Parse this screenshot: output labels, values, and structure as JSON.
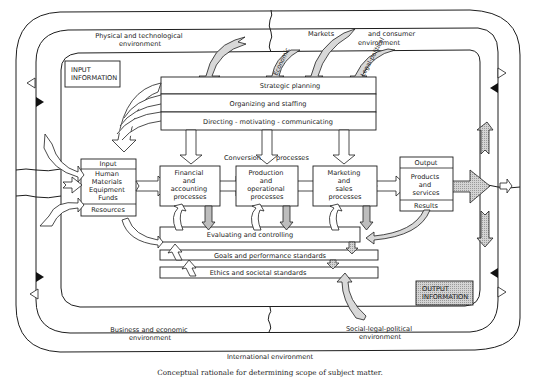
{
  "diagram": {
    "environments": {
      "physical_technological": [
        "Physical and technological",
        "environment"
      ],
      "markets_consumer": [
        "Markets",
        "and consumer",
        "environment"
      ],
      "business_economic": [
        "Business and economic",
        "environment"
      ],
      "social_legal_political": [
        "Social-legal-political",
        "environment"
      ],
      "international": "International environment"
    },
    "influence_arrows": {
      "economic": "Economic",
      "legal_political": "Legal-political"
    },
    "info_boxes": {
      "input": [
        "INPUT",
        "INFORMATION"
      ],
      "output": [
        "OUTPUT",
        "INFORMATION"
      ]
    },
    "management_functions": [
      "Strategic planning",
      "Organizing and staffing",
      "Directing - motivating - communicating"
    ],
    "conversion_label": [
      "Conversion",
      "processes"
    ],
    "input_block": {
      "header": "Input",
      "items": [
        "Human",
        "Materials",
        "Equipment",
        "Funds"
      ],
      "footer": "Resources"
    },
    "processes": [
      {
        "lines": [
          "Financial",
          "and",
          "accounting",
          "processes"
        ]
      },
      {
        "lines": [
          "Production",
          "and",
          "operational",
          "processes"
        ]
      },
      {
        "lines": [
          "Marketing",
          "and",
          "sales",
          "processes"
        ]
      }
    ],
    "output_block": {
      "header": "Output",
      "items": [
        "Products",
        "and",
        "services"
      ],
      "footer": "Results"
    },
    "control_bars": [
      "Evaluating and controlling",
      "Goals and performance standards",
      "Ethics and societal standards"
    ]
  },
  "caption": "Conceptual rationale for determining scope of subject matter.",
  "colors": {
    "line": "#1e1e1e",
    "hatch_fill": "#bdbdbd",
    "output_box_fill": "#d9d9d9",
    "background": "#ffffff"
  }
}
